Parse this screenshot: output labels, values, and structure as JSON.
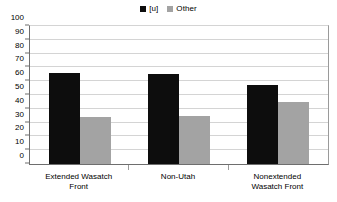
{
  "chart_data": {
    "type": "bar",
    "title": "",
    "subtitle": "",
    "xlabel": "",
    "ylabel": "",
    "ylim": [
      0,
      100
    ],
    "ytick_step": 10,
    "yticks": [
      "100",
      "90",
      "80",
      "70",
      "60",
      "50",
      "40",
      "30",
      "20",
      "10",
      "0"
    ],
    "grid": true,
    "legend_position": "top-center",
    "categories": [
      "Extended Wasatch\nFront",
      "Non-Utah",
      "Nonextended\nWasatch Front"
    ],
    "series": [
      {
        "name": "[u]",
        "color": "#0d0d0d",
        "values": [
          66,
          65,
          57
        ]
      },
      {
        "name": "Other",
        "color": "#a3a3a3",
        "values": [
          34,
          35,
          45
        ]
      }
    ]
  },
  "legend": {
    "items": [
      {
        "label": "[u]",
        "color": "#0d0d0d"
      },
      {
        "label": "Other",
        "color": "#a3a3a3"
      }
    ]
  },
  "colors": {
    "series_a": "#0d0d0d",
    "series_b": "#a3a3a3",
    "gridline": "#d4d4d4",
    "axis": "#6e6e6e",
    "background": "#ffffff",
    "text": "#000000"
  }
}
